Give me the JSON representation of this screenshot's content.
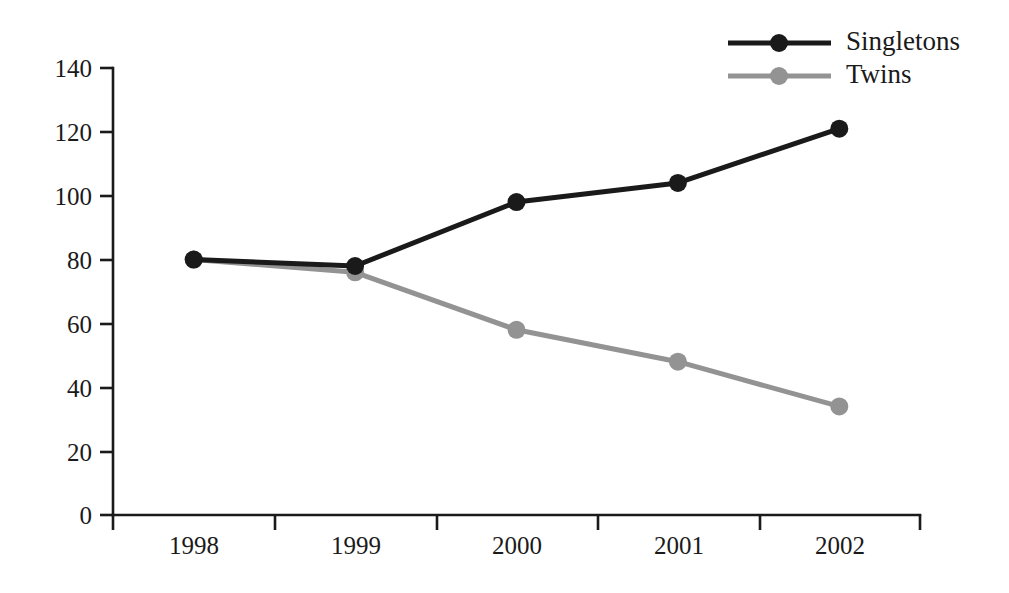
{
  "chart_data": {
    "type": "line",
    "title": "",
    "subtitle": "",
    "xlabel": "",
    "ylabel": "",
    "categories": [
      "1998",
      "1999",
      "2000",
      "2001",
      "2002"
    ],
    "series": [
      {
        "name": "Singletons",
        "color": "#1a1a1a",
        "marker": "circle",
        "values": [
          80,
          78,
          98,
          104,
          121
        ]
      },
      {
        "name": "Twins",
        "color": "#939393",
        "marker": "circle",
        "values": [
          80,
          76,
          58,
          48,
          34
        ]
      }
    ],
    "ylim": [
      0,
      140
    ],
    "ytick_step": 20,
    "yticks": [
      0,
      20,
      40,
      60,
      80,
      100,
      120,
      140
    ],
    "ytick_labels": [
      "0",
      "20",
      "40",
      "60",
      "80",
      "100",
      "120",
      "140"
    ],
    "grid": false,
    "legend_position": "top-right",
    "legend_entries": [
      {
        "label": "Singletons",
        "color": "#1a1a1a"
      },
      {
        "label": "Twins",
        "color": "#939393"
      }
    ],
    "annotations": []
  },
  "axis": {
    "y_tick_0": "0",
    "y_tick_20": "20",
    "y_tick_40": "40",
    "y_tick_60": "60",
    "y_tick_80": "80",
    "y_tick_100": "100",
    "y_tick_120": "120",
    "y_tick_140": "140",
    "x_tick_1998": "1998",
    "x_tick_1999": "1999",
    "x_tick_2000": "2000",
    "x_tick_2001": "2001",
    "x_tick_2002": "2002"
  },
  "legend": {
    "singletons_label": "Singletons",
    "twins_label": "Twins"
  },
  "colors": {
    "singletons": "#1a1a1a",
    "twins": "#939393",
    "axis": "#1a1a1a",
    "background": "#ffffff"
  }
}
